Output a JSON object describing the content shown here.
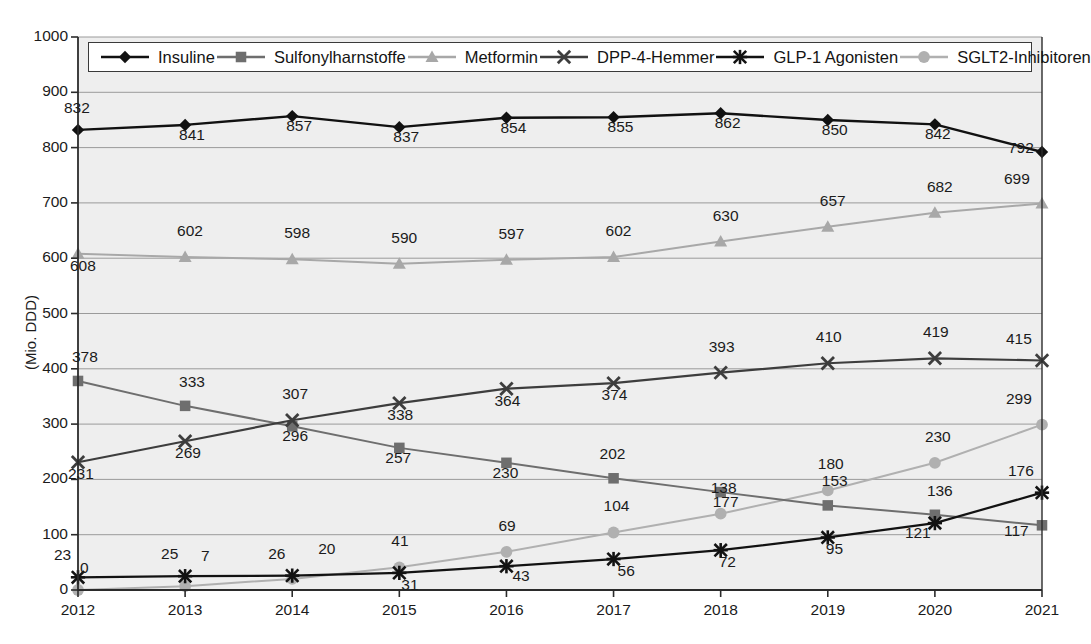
{
  "chart_data": {
    "type": "line",
    "title": "",
    "xlabel": "",
    "ylabel": "(Mio. DDD)",
    "categories": [
      "2012",
      "2013",
      "2014",
      "2015",
      "2016",
      "2017",
      "2018",
      "2019",
      "2020",
      "2021"
    ],
    "ylim": [
      0,
      1000
    ],
    "ytick_step": 100,
    "yticks": [
      "0",
      "100",
      "200",
      "300",
      "400",
      "500",
      "600",
      "700",
      "800",
      "900",
      "1000"
    ],
    "grid": true,
    "legend_position": "top-inside",
    "series": [
      {
        "name": "Insuline",
        "marker": "diamond",
        "color": "#111111",
        "line_width": 2.4,
        "values": [
          832,
          841,
          857,
          837,
          854,
          855,
          862,
          850,
          842,
          792
        ],
        "labels": [
          "832",
          "841",
          "857",
          "837",
          "854",
          "855",
          "862",
          "850",
          "842",
          "792"
        ]
      },
      {
        "name": "Sulfonylharnstoffe",
        "marker": "square",
        "color": "#6e6e6e",
        "line_width": 2.0,
        "values": [
          378,
          333,
          296,
          257,
          230,
          202,
          177,
          153,
          136,
          117
        ],
        "labels": [
          "378",
          "333",
          "296",
          "257",
          "230",
          "202",
          "177",
          "153",
          "136",
          "117"
        ]
      },
      {
        "name": "Metformin",
        "marker": "triangle",
        "color": "#a8a8a8",
        "line_width": 2.0,
        "values": [
          608,
          602,
          598,
          590,
          597,
          602,
          630,
          657,
          682,
          699
        ],
        "labels": [
          "608",
          "602",
          "598",
          "590",
          "597",
          "602",
          "630",
          "657",
          "682",
          "699"
        ]
      },
      {
        "name": "DPP-4-Hemmer",
        "marker": "x-cross",
        "color": "#3d3d3d",
        "line_width": 2.2,
        "values": [
          231,
          269,
          307,
          338,
          364,
          374,
          393,
          410,
          419,
          415
        ],
        "labels": [
          "231",
          "269",
          "307",
          "338",
          "364",
          "374",
          "393",
          "410",
          "419",
          "415"
        ]
      },
      {
        "name": "GLP-1 Agonisten",
        "marker": "asterisk",
        "color": "#121212",
        "line_width": 2.2,
        "values": [
          23,
          25,
          26,
          31,
          43,
          56,
          72,
          95,
          121,
          176
        ],
        "labels": [
          "23",
          "25",
          "26",
          "31",
          "43",
          "56",
          "72",
          "95",
          "121",
          "176"
        ]
      },
      {
        "name": "SGLT2-Inhibitoren",
        "marker": "circle",
        "color": "#b0b0b0",
        "line_width": 2.0,
        "values": [
          0,
          7,
          20,
          41,
          69,
          104,
          138,
          180,
          230,
          299
        ],
        "labels": [
          "0",
          "7",
          "20",
          "41",
          "69",
          "104",
          "138",
          "180",
          "230",
          "299"
        ]
      }
    ]
  },
  "legend": {
    "items": [
      {
        "label": "Insuline",
        "marker": "diamond-marker-icon",
        "color": "#111111"
      },
      {
        "label": "Sulfonylharnstoffe",
        "marker": "square-marker-icon",
        "color": "#6e6e6e"
      },
      {
        "label": "Metformin",
        "marker": "triangle-marker-icon",
        "color": "#a8a8a8"
      },
      {
        "label": "DPP-4-Hemmer",
        "marker": "x-cross-marker-icon",
        "color": "#3d3d3d"
      },
      {
        "label": "GLP-1 Agonisten",
        "marker": "asterisk-marker-icon",
        "color": "#121212"
      },
      {
        "label": "SGLT2-Inhibitoren",
        "marker": "circle-marker-icon",
        "color": "#b0b0b0"
      }
    ]
  },
  "axes": {
    "y_unit_label": "(Mio. DDD)",
    "y_ticks": [
      "1000",
      "900",
      "800",
      "700",
      "600",
      "500",
      "400",
      "300",
      "200",
      "100",
      "0"
    ],
    "x_ticks": [
      "2012",
      "2013",
      "2014",
      "2015",
      "2016",
      "2017",
      "2018",
      "2019",
      "2020",
      "2021"
    ]
  },
  "style": {
    "plot_background": "#eeeeee",
    "grid_color": "#9a9a9a",
    "axis_color": "#2b2b2b",
    "page_background": "#ffffff"
  },
  "label_offsets": {
    "Insuline": [
      [
        -14,
        -22
      ],
      [
        -6,
        10
      ],
      [
        -6,
        10
      ],
      [
        -6,
        10
      ],
      [
        -6,
        10
      ],
      [
        -6,
        10
      ],
      [
        -6,
        10
      ],
      [
        -6,
        10
      ],
      [
        -10,
        10
      ],
      [
        -34,
        -4
      ]
    ],
    "Sulfonylharnstoffe": [
      [
        -6,
        -24
      ],
      [
        -6,
        -24
      ],
      [
        -10,
        10
      ],
      [
        -14,
        10
      ],
      [
        -14,
        10
      ],
      [
        -14,
        -24
      ],
      [
        -8,
        10
      ],
      [
        -6,
        -24
      ],
      [
        -8,
        -24
      ],
      [
        -38,
        6
      ]
    ],
    "Metformin": [
      [
        -8,
        12
      ],
      [
        -8,
        -26
      ],
      [
        -8,
        -26
      ],
      [
        -8,
        -26
      ],
      [
        -8,
        -26
      ],
      [
        -8,
        -26
      ],
      [
        -8,
        -26
      ],
      [
        -8,
        -26
      ],
      [
        -8,
        -26
      ],
      [
        -38,
        -24
      ]
    ],
    "DPP-4-Hemmer": [
      [
        -10,
        12
      ],
      [
        -10,
        12
      ],
      [
        -10,
        -26
      ],
      [
        -12,
        12
      ],
      [
        -12,
        12
      ],
      [
        -12,
        12
      ],
      [
        -12,
        -26
      ],
      [
        -12,
        -26
      ],
      [
        -12,
        -26
      ],
      [
        -36,
        -22
      ]
    ],
    "GLP-1 Agonisten": [
      [
        -24,
        -22
      ],
      [
        -24,
        -22
      ],
      [
        -24,
        -22
      ],
      [
        2,
        12
      ],
      [
        6,
        10
      ],
      [
        4,
        12
      ],
      [
        -2,
        12
      ],
      [
        -2,
        12
      ],
      [
        -30,
        10
      ],
      [
        -34,
        -22
      ]
    ],
    "SGLT2-Inhibitoren": [
      [
        2,
        -22
      ],
      [
        16,
        -30
      ],
      [
        26,
        -30
      ],
      [
        -8,
        -26
      ],
      [
        -8,
        -26
      ],
      [
        -10,
        -26
      ],
      [
        -10,
        -26
      ],
      [
        -10,
        -26
      ],
      [
        -10,
        -26
      ],
      [
        -36,
        -26
      ]
    ]
  }
}
